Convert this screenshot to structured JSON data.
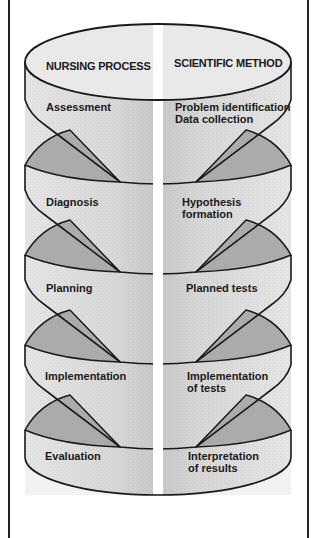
{
  "diagram": {
    "headers": {
      "left": "NURSING PROCESS",
      "right": "SCIENTIFIC METHOD"
    },
    "rows": [
      {
        "nursing": "Assessment",
        "scientific": "Problem identification\nData collection"
      },
      {
        "nursing": "Diagnosis",
        "scientific": "Hypothesis\nformation"
      },
      {
        "nursing": "Planning",
        "scientific": "Planned tests"
      },
      {
        "nursing": "Implementation",
        "scientific": "Implementation\nof tests"
      },
      {
        "nursing": "Evaluation",
        "scientific": "Interpretation\nof results"
      }
    ],
    "colors": {
      "outline": "#1a1a1a",
      "face_light": "#e6e6e6",
      "face_mid": "#cfcfcf",
      "face_dark": "#a9a9a9",
      "channel": "#ffffff"
    }
  }
}
